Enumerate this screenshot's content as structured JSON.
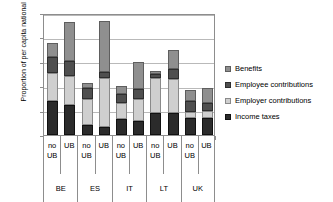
{
  "chart_data": {
    "type": "bar",
    "subtype": "stacked",
    "title": "",
    "xlabel": "",
    "ylabel": "Proportion of per capita national disposable income",
    "ylim": [
      0.0,
      2.5
    ],
    "yticks": [
      "0.0",
      "0.5",
      "1.0",
      "1.5",
      "2.0",
      "2.5"
    ],
    "ytick_values": [
      0.0,
      0.5,
      1.0,
      1.5,
      2.0,
      2.5
    ],
    "grid": true,
    "legend_position": "right",
    "groups": [
      "BE",
      "ES",
      "IT",
      "LT",
      "UK"
    ],
    "scenarios": [
      "no\nUB",
      "UB"
    ],
    "categories": [
      "BE no UB",
      "BE UB",
      "ES no UB",
      "ES UB",
      "IT no UB",
      "IT UB",
      "LT no UB",
      "LT UB",
      "UK no UB",
      "UK UB"
    ],
    "series": [
      {
        "name": "Income taxes",
        "color": "#2b2b2b",
        "values": [
          0.7,
          0.62,
          0.2,
          0.17,
          0.33,
          0.29,
          0.46,
          0.46,
          0.35,
          0.35
        ]
      },
      {
        "name": "Employer contributions",
        "color": "#cfcfcf",
        "values": [
          0.57,
          0.58,
          0.53,
          1.0,
          0.32,
          0.44,
          0.7,
          0.69,
          0.13,
          0.15
        ]
      },
      {
        "name": "Employee contributions",
        "color": "#4f4f4f",
        "values": [
          0.32,
          0.31,
          0.23,
          0.13,
          0.2,
          0.22,
          0.1,
          0.21,
          0.22,
          0.16
        ]
      },
      {
        "name": "Benefits",
        "color": "#8f8f8f",
        "values": [
          0.29,
          0.81,
          0.1,
          1.03,
          0.16,
          0.55,
          0.05,
          0.38,
          0.23,
          0.31
        ]
      }
    ],
    "totals": [
      1.88,
      2.32,
      1.06,
      2.33,
      1.01,
      1.5,
      1.31,
      1.74,
      0.93,
      0.97
    ]
  },
  "legend": {
    "items": [
      {
        "label": "Benefits",
        "swatch": "benefits"
      },
      {
        "label": "Employee contributions",
        "swatch": "employee"
      },
      {
        "label": "Employer contributions",
        "swatch": "employer"
      },
      {
        "label": "Income taxes",
        "swatch": "taxes"
      }
    ]
  },
  "axis": {
    "y_title": "Proportion of per capita national disposable income"
  }
}
